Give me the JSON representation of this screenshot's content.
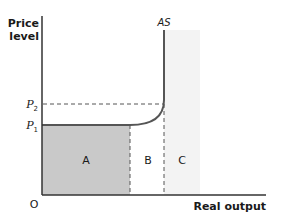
{
  "diagram": {
    "type": "aggregate-supply-diagram",
    "axes": {
      "y_label_line1": "Price",
      "y_label_line2": "level",
      "x_label": "Real output",
      "origin": "O"
    },
    "price_levels": [
      {
        "symbol": "P",
        "subscript": "2"
      },
      {
        "symbol": "P",
        "subscript": "1"
      }
    ],
    "curve": {
      "label": "AS"
    },
    "regions": [
      {
        "label": "A",
        "fill": "#c9c9c9",
        "description": "horizontal range of AS (shaded dark)"
      },
      {
        "label": "B",
        "fill": "#ffffff",
        "description": "intermediate upward-sloping range"
      },
      {
        "label": "C",
        "fill": "#f3f3f3",
        "description": "vertical range of AS (shaded light)"
      }
    ],
    "colors": {
      "axis": "#333333",
      "curve": "#555555",
      "dashed": "#555555",
      "region_a": "#c9c9c9",
      "region_c": "#f3f3f3"
    }
  }
}
